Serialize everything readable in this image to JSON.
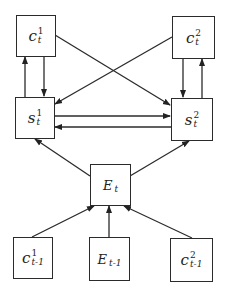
{
  "diagram": {
    "nodes": {
      "c1_t": {
        "base": "c",
        "sup": "1",
        "sub": "t"
      },
      "c2_t": {
        "base": "c",
        "sup": "2",
        "sub": "t"
      },
      "s1_t": {
        "base": "s",
        "sup": "1",
        "sub": "t"
      },
      "s2_t": {
        "base": "s",
        "sup": "2",
        "sub": "t"
      },
      "E_t": {
        "base": "E",
        "sub": "t"
      },
      "c1_tm1": {
        "base": "c",
        "sup": "1",
        "sub": "t-1"
      },
      "E_tm1": {
        "base": "E",
        "sub": "t-1"
      },
      "c2_tm1": {
        "base": "c",
        "sup": "2",
        "sub": "t-1"
      }
    },
    "edges": [
      {
        "from": "s1_t",
        "to": "c1_t"
      },
      {
        "from": "c1_t",
        "to": "s1_t"
      },
      {
        "from": "c2_t",
        "to": "s2_t"
      },
      {
        "from": "s2_t",
        "to": "c2_t"
      },
      {
        "from": "c1_t",
        "to": "s2_t"
      },
      {
        "from": "c2_t",
        "to": "s1_t"
      },
      {
        "from": "s1_t",
        "to": "s2_t"
      },
      {
        "from": "s2_t",
        "to": "s1_t"
      },
      {
        "from": "E_t",
        "to": "s1_t"
      },
      {
        "from": "E_t",
        "to": "s2_t"
      },
      {
        "from": "c1_tm1",
        "to": "E_t"
      },
      {
        "from": "E_tm1",
        "to": "E_t"
      },
      {
        "from": "c2_tm1",
        "to": "E_t"
      }
    ]
  }
}
